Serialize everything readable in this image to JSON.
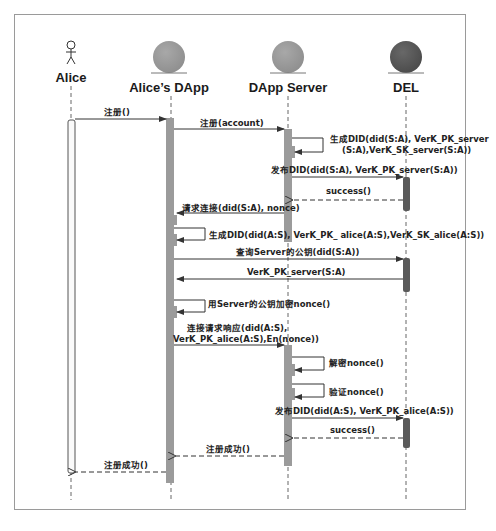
{
  "participants": [
    {
      "name": "Alice",
      "kind": "actor",
      "x": 71
    },
    {
      "name": "Alice’s DApp",
      "kind": "entity",
      "x": 171,
      "color": "#9b9b9b"
    },
    {
      "name": "DApp Server",
      "kind": "entity",
      "x": 288,
      "color": "#9b9b9b"
    },
    {
      "name": "DEL",
      "kind": "entity",
      "x": 406,
      "color": "#5a5a5a"
    }
  ],
  "messages": [
    {
      "label": "注册()",
      "from": "Alice",
      "to": "Alice’s DApp",
      "type": "sync"
    },
    {
      "label": "注册(account)",
      "from": "Alice’s DApp",
      "to": "DApp Server",
      "type": "sync"
    },
    {
      "label": "生成DID(did(S:A), VerK_PK_server",
      "label2": "(S:A),VerK_SK_server(S:A))",
      "from": "DApp Server",
      "to": "DApp Server",
      "type": "self"
    },
    {
      "label": "发布DID(did(S:A), VerK_PK_server(S:A))",
      "from": "DApp Server",
      "to": "DEL",
      "type": "sync"
    },
    {
      "label": "success()",
      "from": "DEL",
      "to": "DApp Server",
      "type": "return"
    },
    {
      "label": "请求连接(did(S:A), nonce)",
      "from": "DApp Server",
      "to": "Alice’s DApp",
      "type": "sync"
    },
    {
      "label": "生成DID(did(A:S), VerK_PK_ alice(A:S),VerK_SK_alice(A:S))",
      "from": "Alice’s DApp",
      "to": "Alice’s DApp",
      "type": "self"
    },
    {
      "label": "查询Server的公钥(did(S:A))",
      "from": "Alice’s DApp",
      "to": "DEL",
      "type": "sync"
    },
    {
      "label": "VerK_PK_server(S:A)",
      "from": "DEL",
      "to": "Alice’s DApp",
      "type": "sync"
    },
    {
      "label": "用Server的公钥加密nonce()",
      "from": "Alice’s DApp",
      "to": "Alice’s DApp",
      "type": "self"
    },
    {
      "label": "连接请求响应(did(A:S),",
      "label2": "VerK_PK_alice(A:S),En(nonce))",
      "from": "Alice’s DApp",
      "to": "DApp Server",
      "type": "sync"
    },
    {
      "label": "解密nonce()",
      "from": "DApp Server",
      "to": "DApp Server",
      "type": "self"
    },
    {
      "label": "验证nonce()",
      "from": "DApp Server",
      "to": "DApp Server",
      "type": "self"
    },
    {
      "label": "发布DID(did(A:S), VerK_PK_alice(A:S))",
      "from": "DApp Server",
      "to": "DEL",
      "type": "sync"
    },
    {
      "label": "success()",
      "from": "DEL",
      "to": "DApp Server",
      "type": "return"
    },
    {
      "label": "注册成功()",
      "from": "DApp Server",
      "to": "Alice’s DApp",
      "type": "return"
    },
    {
      "label": "注册成功()",
      "from": "Alice’s DApp",
      "to": "Alice",
      "type": "return"
    }
  ],
  "colors": {
    "activation": "#9b9b9b",
    "del_activation": "#5a5a5a",
    "line": "#333333",
    "border": "#9a9a9a"
  }
}
